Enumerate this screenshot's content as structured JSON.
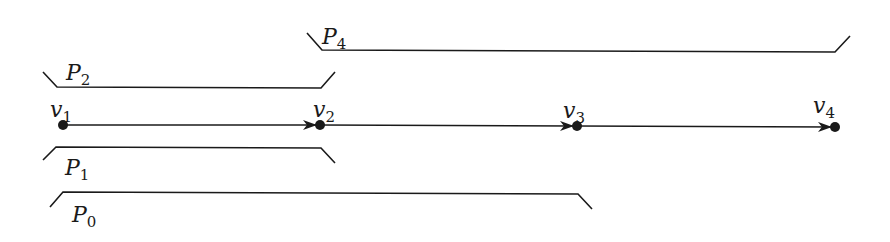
{
  "diagram": {
    "type": "path-graph",
    "vertices": [
      {
        "id": "v1",
        "label": "v",
        "sub": "1",
        "x": 63,
        "y": 125
      },
      {
        "id": "v2",
        "label": "v",
        "sub": "2",
        "x": 320,
        "y": 125
      },
      {
        "id": "v3",
        "label": "v",
        "sub": "3",
        "x": 577,
        "y": 126
      },
      {
        "id": "v4",
        "label": "v",
        "sub": "4",
        "x": 835,
        "y": 127
      }
    ],
    "edges": [
      {
        "from": "v1",
        "to": "v2",
        "directed": true
      },
      {
        "from": "v2",
        "to": "v3",
        "directed": true
      },
      {
        "from": "v3",
        "to": "v4",
        "directed": true
      }
    ],
    "paths": [
      {
        "id": "P4",
        "label": "P",
        "sub": "4",
        "spans": [
          "v2",
          "v4"
        ],
        "side": "above"
      },
      {
        "id": "P2",
        "label": "P",
        "sub": "2",
        "spans": [
          "v1",
          "v2"
        ],
        "side": "above"
      },
      {
        "id": "P1",
        "label": "P",
        "sub": "1",
        "spans": [
          "v1",
          "v2"
        ],
        "side": "below"
      },
      {
        "id": "P0",
        "label": "P",
        "sub": "0",
        "spans": [
          "v1",
          "v3"
        ],
        "side": "below"
      }
    ],
    "colors": {
      "stroke": "#1a1a1a",
      "background": "#ffffff"
    }
  }
}
